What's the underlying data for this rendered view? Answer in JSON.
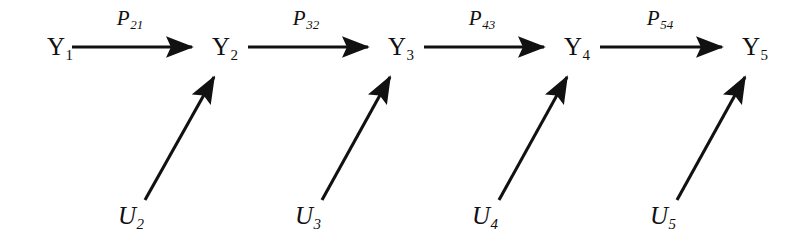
{
  "diagram": {
    "type": "recursive-path-diagram",
    "background_color": "#ffffff",
    "stroke_color": "#111111",
    "canvas": {
      "width": 790,
      "height": 243
    },
    "endogenous_nodes": [
      {
        "id": "Y1",
        "base": "Y",
        "sub": "1",
        "x": 47,
        "y": 47
      },
      {
        "id": "Y2",
        "base": "Y",
        "sub": "2",
        "x": 212,
        "y": 47
      },
      {
        "id": "Y3",
        "base": "Y",
        "sub": "3",
        "x": 388,
        "y": 47
      },
      {
        "id": "Y4",
        "base": "Y",
        "sub": "4",
        "x": 564,
        "y": 47
      },
      {
        "id": "Y5",
        "base": "Y",
        "sub": "5",
        "x": 742,
        "y": 47
      }
    ],
    "disturbance_nodes": [
      {
        "id": "U2",
        "base": "U",
        "sub": "2",
        "x": 118,
        "y": 214
      },
      {
        "id": "U3",
        "base": "U",
        "sub": "3",
        "x": 295,
        "y": 214
      },
      {
        "id": "U4",
        "base": "U",
        "sub": "4",
        "x": 472,
        "y": 214
      },
      {
        "id": "U5",
        "base": "U",
        "sub": "5",
        "x": 650,
        "y": 214
      }
    ],
    "path_coefficients": [
      {
        "id": "P21",
        "base": "P",
        "sub": "21",
        "from": "Y1",
        "to": "Y2",
        "x": 126,
        "y": 8
      },
      {
        "id": "P32",
        "base": "P",
        "sub": "32",
        "from": "Y2",
        "to": "Y3",
        "x": 302,
        "y": 8
      },
      {
        "id": "P43",
        "base": "P",
        "sub": "43",
        "from": "Y3",
        "to": "Y4",
        "x": 478,
        "y": 8
      },
      {
        "id": "P54",
        "base": "P",
        "sub": "54",
        "from": "Y4",
        "to": "Y5",
        "x": 656,
        "y": 8
      }
    ],
    "horizontal_arrows": [
      {
        "id": "arrow-Y1-Y2",
        "from": "Y1",
        "to": "Y2",
        "x1": 72,
        "y1": 47,
        "x2": 198,
        "y2": 47
      },
      {
        "id": "arrow-Y2-Y3",
        "from": "Y2",
        "to": "Y3",
        "x1": 248,
        "y1": 47,
        "x2": 374,
        "y2": 47
      },
      {
        "id": "arrow-Y3-Y4",
        "from": "Y3",
        "to": "Y4",
        "x1": 424,
        "y1": 47,
        "x2": 550,
        "y2": 47
      },
      {
        "id": "arrow-Y4-Y5",
        "from": "Y4",
        "to": "Y5",
        "x1": 600,
        "y1": 47,
        "x2": 728,
        "y2": 47
      }
    ],
    "diagonal_arrows": [
      {
        "id": "arrow-U2-Y2",
        "from": "U2",
        "to": "Y2",
        "x1": 145,
        "y1": 200,
        "x2": 218,
        "y2": 70
      },
      {
        "id": "arrow-U3-Y3",
        "from": "U3",
        "to": "Y3",
        "x1": 322,
        "y1": 200,
        "x2": 394,
        "y2": 70
      },
      {
        "id": "arrow-U4-Y4",
        "from": "U4",
        "to": "Y4",
        "x1": 499,
        "y1": 200,
        "x2": 571,
        "y2": 70
      },
      {
        "id": "arrow-U5-Y5",
        "from": "U5",
        "to": "Y5",
        "x1": 677,
        "y1": 200,
        "x2": 749,
        "y2": 70
      }
    ]
  }
}
